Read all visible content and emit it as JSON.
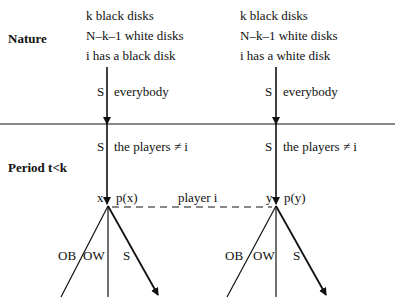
{
  "stages": {
    "nature_label": "Nature",
    "period_label": "Period t<k"
  },
  "left_branch": {
    "lines": [
      "k black disks",
      "N–k–1 white disks",
      "i has a black disk"
    ],
    "move1_action": "S",
    "move1_player": "everybody",
    "move2_action": "S",
    "move2_player": "the players ≠ i",
    "node_label": "x",
    "node_prob": "p(x)",
    "actions": [
      "OB",
      "OW",
      "S"
    ]
  },
  "right_branch": {
    "lines": [
      "k black disks",
      "N–k–1 white disks",
      "i has a white disk"
    ],
    "move1_action": "S",
    "move1_player": "everybody",
    "move2_action": "S",
    "move2_player": "the players ≠ i",
    "node_label": "y",
    "node_prob": "p(y)",
    "actions": [
      "OB",
      "OW",
      "S"
    ]
  },
  "information_set": {
    "label": "player i"
  },
  "colors": {
    "ink": "#111111",
    "background": "#ffffff"
  }
}
